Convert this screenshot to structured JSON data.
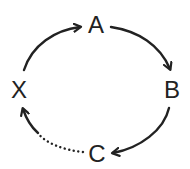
{
  "diagram": {
    "type": "cycle",
    "nodes": [
      {
        "id": "A",
        "label": "A",
        "x": 96,
        "y": 25
      },
      {
        "id": "B",
        "label": "B",
        "x": 172,
        "y": 90
      },
      {
        "id": "C",
        "label": "C",
        "x": 97,
        "y": 154
      },
      {
        "id": "X",
        "label": "X",
        "x": 20,
        "y": 90
      }
    ],
    "edges": [
      {
        "from": "X",
        "to": "A",
        "style": "solid"
      },
      {
        "from": "A",
        "to": "B",
        "style": "solid"
      },
      {
        "from": "B",
        "to": "C",
        "style": "solid"
      },
      {
        "from": "C",
        "to": "X",
        "style": "dotted"
      }
    ],
    "colors": {
      "stroke": "#222222",
      "background": "#ffffff"
    }
  }
}
